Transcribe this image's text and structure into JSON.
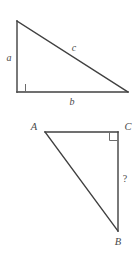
{
  "figure": {
    "background_color": "#ffffff",
    "stroke_color": "#404040",
    "label_color": "#4a4a4a",
    "stroke_width": 1.4,
    "diagrams": [
      {
        "name": "right-triangle-abc-lowercase",
        "description": "Right triangle with the right angle at the lower-left vertex",
        "right_angle_vertex": "lower-left",
        "vertices": [
          {
            "name": "apex",
            "x": 17,
            "y": 21
          },
          {
            "name": "right-angle-corner",
            "x": 17,
            "y": 92
          },
          {
            "name": "right-vertex",
            "x": 128,
            "y": 92
          }
        ],
        "labels": [
          {
            "id": "leg-a",
            "text": "a",
            "x": 9,
            "y": 61,
            "side": "vertical-leg"
          },
          {
            "id": "hypotenuse-c",
            "text": "c",
            "x": 74,
            "y": 51,
            "side": "hypotenuse"
          },
          {
            "id": "leg-b",
            "text": "b",
            "x": 72,
            "y": 105,
            "side": "horizontal-leg"
          }
        ]
      },
      {
        "name": "right-triangle-ABC-uppercase",
        "description": "Right triangle with the right angle at vertex C (upper-right)",
        "right_angle_vertex": "C",
        "vertices": [
          {
            "name": "A",
            "x": 45,
            "y": 132
          },
          {
            "name": "C",
            "x": 118,
            "y": 132
          },
          {
            "name": "B",
            "x": 118,
            "y": 231
          }
        ],
        "labels": [
          {
            "id": "vertex-A",
            "text": "A",
            "x": 34,
            "y": 130
          },
          {
            "id": "vertex-C",
            "text": "C",
            "x": 127,
            "y": 130
          },
          {
            "id": "vertex-B",
            "text": "B",
            "x": 118,
            "y": 245
          },
          {
            "id": "unknown-side",
            "text": "?",
            "x": 125,
            "y": 182,
            "side": "CB"
          }
        ]
      }
    ]
  }
}
